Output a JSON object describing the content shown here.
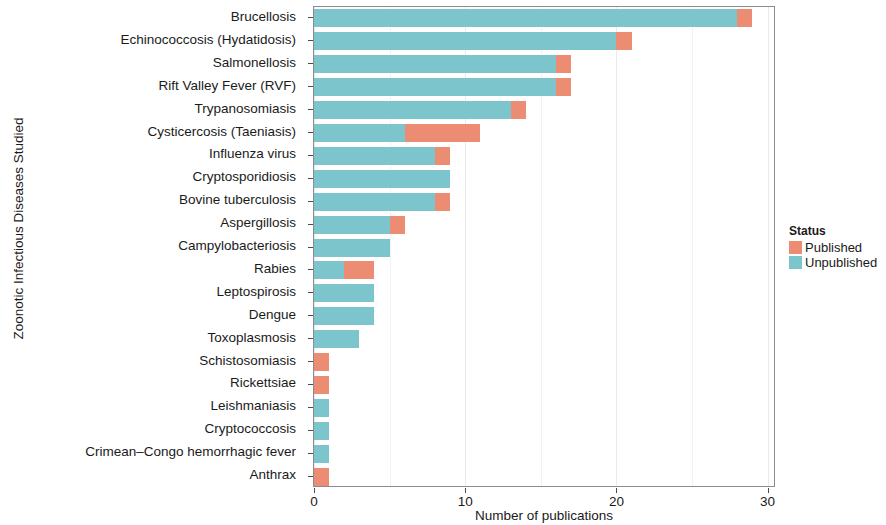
{
  "chart_data": {
    "type": "bar",
    "orientation": "horizontal",
    "stacked": true,
    "title": "",
    "xlabel": "Number of publications",
    "ylabel": "Zoonotic Infectious Diseases Studied",
    "xlim": [
      0,
      30.6
    ],
    "xticks": [
      0,
      10,
      20,
      30
    ],
    "xticklabels": [
      "0",
      "10",
      "20",
      "30"
    ],
    "grid": "vertical",
    "legend": {
      "title": "Status",
      "position": "right",
      "entries": [
        {
          "name": "Published",
          "color": "#ec8c72"
        },
        {
          "name": "Unpublished",
          "color": "#7cc5cc"
        }
      ]
    },
    "categories": [
      "Brucellosis",
      "Echinococcosis (Hydatidosis)",
      "Salmonellosis",
      "Rift Valley Fever (RVF)",
      "Trypanosomiasis",
      "Cysticercosis (Taeniasis)",
      "Influenza virus",
      "Cryptosporidiosis",
      "Bovine tuberculosis",
      "Aspergillosis",
      "Campylobacteriosis",
      "Rabies",
      "Leptospirosis",
      "Dengue",
      "Toxoplasmosis",
      "Schistosomiasis",
      "Rickettsiae",
      "Leishmaniasis",
      "Cryptococcosis",
      "Crimean–Congo hemorrhagic fever",
      "Anthrax"
    ],
    "series": [
      {
        "name": "Unpublished",
        "color": "#7cc5cc",
        "values": [
          28,
          20,
          16,
          16,
          13,
          6,
          8,
          9,
          8,
          5,
          5,
          2,
          4,
          4,
          3,
          0,
          0,
          1,
          1,
          1,
          0
        ]
      },
      {
        "name": "Published",
        "color": "#ec8c72",
        "values": [
          1,
          1,
          1,
          1,
          1,
          5,
          1,
          0,
          1,
          1,
          0,
          2,
          0,
          0,
          0,
          1,
          1,
          0,
          0,
          0,
          1
        ]
      }
    ],
    "totals": [
      29,
      21,
      17,
      17,
      14,
      11,
      9,
      9,
      9,
      6,
      5,
      4,
      4,
      4,
      3,
      1,
      1,
      1,
      1,
      1,
      1
    ]
  }
}
